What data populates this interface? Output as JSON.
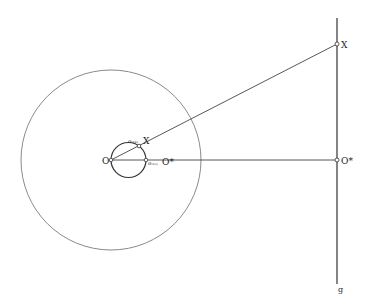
{
  "diagram": {
    "type": "geometric-construction",
    "colors": {
      "line": "#333333",
      "big_circle": "#8a8a8a",
      "background": "#ffffff"
    },
    "points": {
      "O": {
        "label": "O",
        "x": 111,
        "y": 160
      },
      "X_small": {
        "label": "X",
        "prefix": "σ₀₍ₓ₎",
        "x": 139,
        "y": 146
      },
      "O_star_small": {
        "label": "O*",
        "prefix": "σ₀₍ₒ₎",
        "x": 146,
        "y": 160
      },
      "X": {
        "label": "X",
        "x": 337,
        "y": 44
      },
      "O_star": {
        "label": "O*",
        "x": 337,
        "y": 160
      }
    },
    "line_g": {
      "label": "g",
      "x": 337,
      "y1": 18,
      "y2": 284
    },
    "big_circle": {
      "cx": 111,
      "cy": 160,
      "r": 90
    },
    "small_circle": {
      "cx": 128.5,
      "cy": 160,
      "r": 17.5
    }
  }
}
